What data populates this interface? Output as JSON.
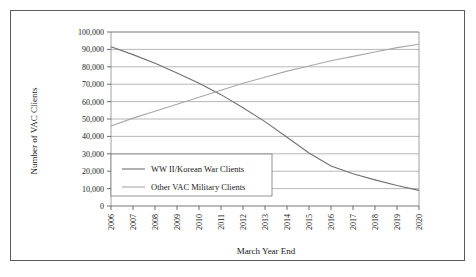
{
  "chart_data": {
    "type": "line",
    "title": "",
    "xlabel": "March Year End",
    "ylabel": "Number of VAC Clients",
    "categories": [
      "2006",
      "2007",
      "2008",
      "2009",
      "2010",
      "2011",
      "2012",
      "2013",
      "2014",
      "2015",
      "2016",
      "2017",
      "2018",
      "2019",
      "2020"
    ],
    "x": [
      2006,
      2007,
      2008,
      2009,
      2010,
      2011,
      2012,
      2013,
      2014,
      2015,
      2016,
      2017,
      2018,
      2019,
      2020
    ],
    "ylim": [
      0,
      100000
    ],
    "yticks": [
      0,
      10000,
      20000,
      30000,
      40000,
      50000,
      60000,
      70000,
      80000,
      90000,
      100000
    ],
    "ytick_labels": [
      "0",
      "10,000",
      "20,000",
      "30,000",
      "40,000",
      "50,000",
      "60,000",
      "70,000",
      "80,000",
      "90,000",
      "100,000"
    ],
    "grid": true,
    "legend_position": "inside-lower-left",
    "series": [
      {
        "name": "WW II/Korean War Clients",
        "color": "#707070",
        "values": [
          91500,
          87000,
          82000,
          76500,
          70500,
          64000,
          56500,
          48500,
          39500,
          30500,
          23000,
          18500,
          15000,
          11800,
          9000
        ]
      },
      {
        "name": "Other VAC Military Clients",
        "color": "#a8a8a8",
        "values": [
          46000,
          50500,
          54500,
          58500,
          62500,
          66500,
          70500,
          74000,
          77500,
          80500,
          83500,
          86000,
          88500,
          91000,
          93000
        ]
      }
    ]
  },
  "legend": {
    "items": [
      {
        "label": "WW II/Korean War Clients"
      },
      {
        "label": "Other VAC Military Clients"
      }
    ]
  },
  "axes": {
    "x_title": "March Year End",
    "y_title": "Number of VAC Clients"
  }
}
